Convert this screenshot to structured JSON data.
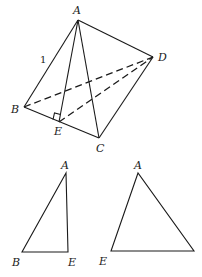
{
  "diagram": {
    "tetrahedron": {
      "vertices": {
        "A": {
          "label": "A",
          "x": 78,
          "y": 20
        },
        "B": {
          "label": "B",
          "x": 24,
          "y": 107
        },
        "C": {
          "label": "C",
          "x": 99,
          "y": 138
        },
        "D": {
          "label": "D",
          "x": 153,
          "y": 57
        },
        "E": {
          "label": "E",
          "x": 59,
          "y": 122
        }
      },
      "edge_label_AB": "1",
      "solid_edges": [
        "AB",
        "AC",
        "AD",
        "AE",
        "BE",
        "EC",
        "CD"
      ],
      "dashed_edges": [
        "BD",
        "ED"
      ],
      "right_angle_at": "E"
    },
    "triangle_ABE": {
      "vertices": {
        "A": {
          "label": "A",
          "x": 66,
          "y": 173
        },
        "B": {
          "label": "B",
          "x": 22,
          "y": 252
        },
        "E": {
          "label": "E",
          "x": 68,
          "y": 252
        }
      }
    },
    "triangle_AED": {
      "vertices": {
        "A": {
          "label": "A",
          "x": 138,
          "y": 173
        },
        "E": {
          "label": "E",
          "x": 111,
          "y": 251
        },
        "D": {
          "label": "",
          "x": 194,
          "y": 251
        }
      }
    }
  }
}
